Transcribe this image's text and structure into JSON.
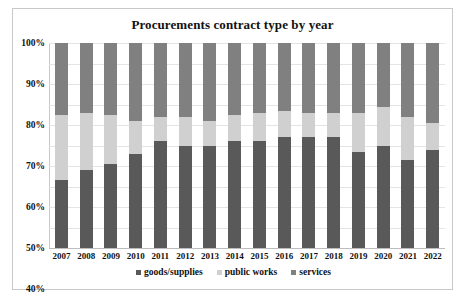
{
  "chart_data": {
    "type": "bar",
    "subtype": "stacked-100-percent",
    "title": "Procurements contract type by year",
    "xlabel": "",
    "ylabel": "",
    "ylim": [
      0,
      100
    ],
    "yticks": [
      "0%",
      "10%",
      "20%",
      "30%",
      "40%",
      "50%",
      "60%",
      "70%",
      "80%",
      "90%",
      "100%"
    ],
    "ytick_values": [
      0,
      10,
      20,
      30,
      40,
      50,
      60,
      70,
      80,
      90,
      100
    ],
    "grid": true,
    "legend_position": "bottom",
    "categories": [
      "2007",
      "2008",
      "2009",
      "2010",
      "2011",
      "2012",
      "2013",
      "2014",
      "2015",
      "2016",
      "2017",
      "2018",
      "2019",
      "2020",
      "2021",
      "2022"
    ],
    "series": [
      {
        "name": "goods/supplies",
        "color": "#595959",
        "values": [
          33,
          38,
          41,
          46,
          52,
          50,
          50,
          52,
          52,
          54,
          54,
          54,
          47,
          50,
          43,
          48
        ]
      },
      {
        "name": "public works",
        "color": "#d0d0d0",
        "values": [
          32,
          28,
          24,
          16,
          12,
          14,
          12,
          13,
          14,
          13,
          12,
          12,
          19,
          19,
          21,
          13
        ]
      },
      {
        "name": "services",
        "color": "#808080",
        "values": [
          35,
          34,
          35,
          38,
          36,
          36,
          38,
          35,
          34,
          33,
          34,
          34,
          34,
          31,
          36,
          39
        ]
      }
    ]
  },
  "legend": {
    "items": [
      {
        "label": "goods/supplies",
        "color": "#595959",
        "marker": "square-marker-icon"
      },
      {
        "label": "public works",
        "color": "#d0d0d0",
        "marker": "square-marker-icon"
      },
      {
        "label": "services",
        "color": "#808080",
        "marker": "square-marker-icon"
      }
    ]
  },
  "colors": {
    "goods_supplies": "#595959",
    "public_works": "#d0d0d0",
    "services": "#808080",
    "gridline": "#e4e4e4",
    "axis": "#c9c9c9",
    "border": "#c8c8c8",
    "text": "#111111",
    "background": "#ffffff"
  }
}
